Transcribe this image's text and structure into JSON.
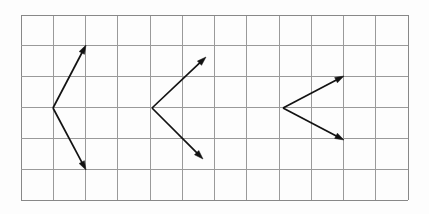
{
  "figure": {
    "type": "vector-diagram",
    "title": "",
    "canvas": {
      "width": 429,
      "height": 214,
      "background": "#fdfdfd"
    },
    "grid": {
      "label": "square grid",
      "x0": 21,
      "y0": 15,
      "x1": 408,
      "y1": 200,
      "columns": 12,
      "rows": 6,
      "cell_width": 32.25,
      "cell_height": 30.83,
      "line_color": "#9a9a9a",
      "border_color": "#888888",
      "line_width": 1,
      "visible": true
    },
    "vectors": {
      "stroke_color": "#121212",
      "stroke_width": 1.7,
      "arrowhead": "filled-triangle",
      "arrowhead_length": 9,
      "arrowhead_width": 6,
      "groups": [
        {
          "name": "vector-pair-left",
          "vertex": {
            "x": 53,
            "y": 108
          },
          "arrows": [
            {
              "name": "arrow-up-right",
              "x1": 53,
              "y1": 108,
              "x2": 86,
              "y2": 45,
              "direction": "up-right"
            },
            {
              "name": "arrow-down-right",
              "x1": 53,
              "y1": 108,
              "x2": 86,
              "y2": 170,
              "direction": "down-right"
            }
          ]
        },
        {
          "name": "vector-pair-middle",
          "vertex": {
            "x": 152,
            "y": 108
          },
          "arrows": [
            {
              "name": "arrow-up-right",
              "x1": 152,
              "y1": 108,
              "x2": 206,
              "y2": 57,
              "direction": "up-right"
            },
            {
              "name": "arrow-down-right",
              "x1": 152,
              "y1": 108,
              "x2": 203,
              "y2": 159,
              "direction": "down-right"
            }
          ]
        },
        {
          "name": "vector-pair-right",
          "vertex": {
            "x": 283,
            "y": 108
          },
          "arrows": [
            {
              "name": "arrow-up-right",
              "x1": 283,
              "y1": 108,
              "x2": 344,
              "y2": 76,
              "direction": "up-right"
            },
            {
              "name": "arrow-down-right",
              "x1": 283,
              "y1": 108,
              "x2": 344,
              "y2": 140,
              "direction": "down-right"
            }
          ]
        }
      ]
    }
  }
}
